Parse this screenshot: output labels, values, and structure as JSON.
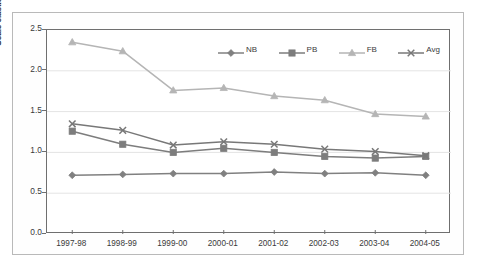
{
  "chart_data": {
    "type": "line",
    "title": "",
    "xlabel": "",
    "ylabel": "Scale elasticity (SE)",
    "categories": [
      "1997-98",
      "1998-99",
      "1999-00",
      "2000-01",
      "2001-02",
      "2002-03",
      "2003-04",
      "2004-05"
    ],
    "ylim": [
      0.0,
      2.5
    ],
    "ytick_labels": [
      "0.0",
      "0.5",
      "1.0",
      "1.5",
      "2.0",
      "2.5"
    ],
    "ytick_values": [
      0.0,
      0.5,
      1.0,
      1.5,
      2.0,
      2.5
    ],
    "grid": "horizontal",
    "legend_position": "top-right-inside",
    "series": [
      {
        "name": "NB",
        "marker": "diamond",
        "color": "#808080",
        "values": [
          0.72,
          0.73,
          0.74,
          0.74,
          0.76,
          0.74,
          0.75,
          0.72
        ]
      },
      {
        "name": "PB",
        "marker": "square",
        "color": "#7d7d7d",
        "values": [
          1.26,
          1.1,
          1.0,
          1.05,
          1.0,
          0.95,
          0.93,
          0.95
        ]
      },
      {
        "name": "FB",
        "marker": "triangle",
        "color": "#b5b5b5",
        "values": [
          2.35,
          2.24,
          1.76,
          1.79,
          1.69,
          1.64,
          1.47,
          1.44
        ]
      },
      {
        "name": "Avg",
        "marker": "x",
        "color": "#787878",
        "values": [
          1.35,
          1.27,
          1.09,
          1.13,
          1.1,
          1.04,
          1.01,
          0.96
        ]
      }
    ]
  },
  "axis": {
    "y_title": "Scale elasticity (SE)"
  }
}
